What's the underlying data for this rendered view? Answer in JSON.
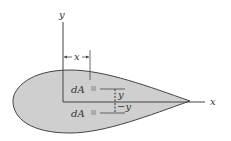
{
  "figure": {
    "shape_fill": "#cfcfcf",
    "stroke": "#444444",
    "labels": {
      "y_axis": "y",
      "x_axis": "x",
      "x_dimension": "x",
      "dA_upper": "dA",
      "dA_lower": "dA",
      "y_upper": "y",
      "y_lower": "−y"
    }
  }
}
